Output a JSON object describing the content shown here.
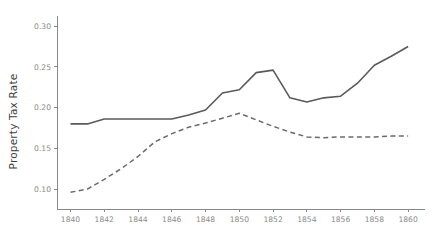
{
  "chart_data": {
    "type": "line",
    "title": "",
    "subtitle": "",
    "xlabel": "",
    "ylabel": "Property Tax Rate",
    "xlim": [
      1839.2,
      1861.0
    ],
    "ylim": [
      0.0755,
      0.3125
    ],
    "xticks": [
      1840,
      1842,
      1844,
      1846,
      1848,
      1850,
      1852,
      1854,
      1856,
      1858,
      1860
    ],
    "xtick_labels": [
      "1840",
      "1842",
      "1844",
      "1846",
      "1848",
      "1850",
      "1852",
      "1854",
      "1856",
      "1858",
      "1860"
    ],
    "yticks": [
      0.1,
      0.15,
      0.2,
      0.25,
      0.3
    ],
    "ytick_labels": [
      "0.10",
      "0.15",
      "0.20",
      "0.25",
      "0.30"
    ],
    "grid": false,
    "legend": null,
    "x": [
      1840,
      1841,
      1842,
      1843,
      1844,
      1845,
      1846,
      1847,
      1848,
      1849,
      1850,
      1851,
      1852,
      1853,
      1854,
      1855,
      1856,
      1857,
      1858,
      1859,
      1860
    ],
    "series": [
      {
        "name": "solid-series",
        "style": "solid",
        "color": "#5a5a5a",
        "width": 1.6,
        "values": [
          0.18,
          0.18,
          0.186,
          0.186,
          0.186,
          0.186,
          0.186,
          0.191,
          0.197,
          0.218,
          0.222,
          0.243,
          0.246,
          0.212,
          0.207,
          0.212,
          0.214,
          0.23,
          0.252,
          0.263,
          0.275
        ]
      },
      {
        "name": "dashed-series",
        "style": "dashed",
        "color": "#6b6b6b",
        "width": 1.5,
        "values": [
          0.096,
          0.1,
          0.112,
          0.125,
          0.14,
          0.158,
          0.168,
          0.176,
          0.181,
          0.187,
          0.193,
          0.185,
          0.177,
          0.17,
          0.164,
          0.163,
          0.164,
          0.164,
          0.164,
          0.165,
          0.165
        ]
      }
    ],
    "axis_color": "#8a8a8a",
    "tick_label_color": "#8a8a8a",
    "axis_label_color": "#3f3f3f",
    "background_color": "#ffffff",
    "plot_box": {
      "left": 57,
      "right": 425,
      "top": 16,
      "bottom": 209
    }
  }
}
